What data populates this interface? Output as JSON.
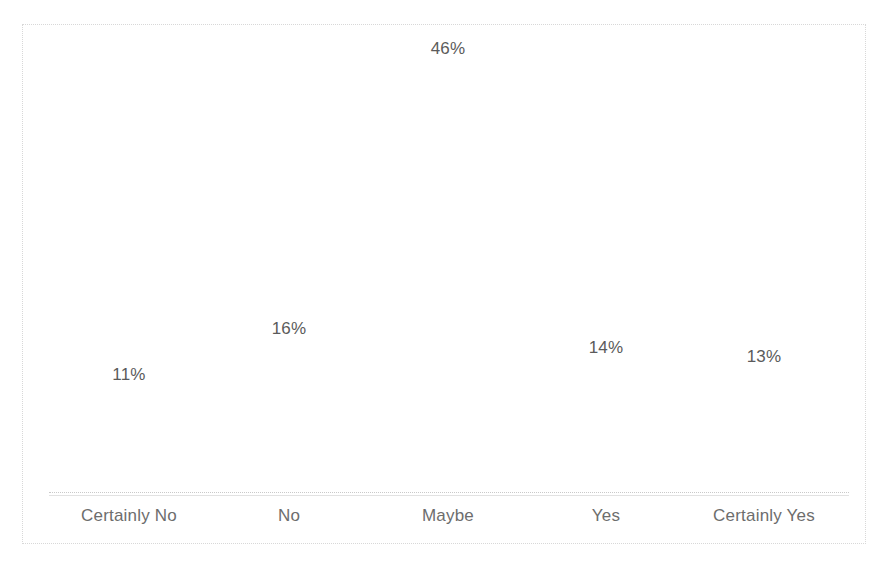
{
  "chart_data": {
    "type": "bar",
    "title": "",
    "subtitle": "",
    "xlabel": "",
    "ylabel": "",
    "categories": [
      "Certainly No",
      "No",
      "Maybe",
      "Yes",
      "Certainly Yes"
    ],
    "values": [
      11,
      16,
      46,
      14,
      13
    ],
    "value_labels": [
      "11%",
      "16%",
      "46%",
      "14%",
      "13%"
    ],
    "ylim": [
      0,
      50
    ],
    "grid": false,
    "legend": null,
    "legend_position": "none",
    "colors": {
      "bar_fill": "#ffffff",
      "value_label_text": "#5b5b5b",
      "category_label_text": "#6d6d6d",
      "axis_line": "#c9c9c9",
      "frame_border": "#d8d8d8",
      "background": "#ffffff"
    }
  }
}
